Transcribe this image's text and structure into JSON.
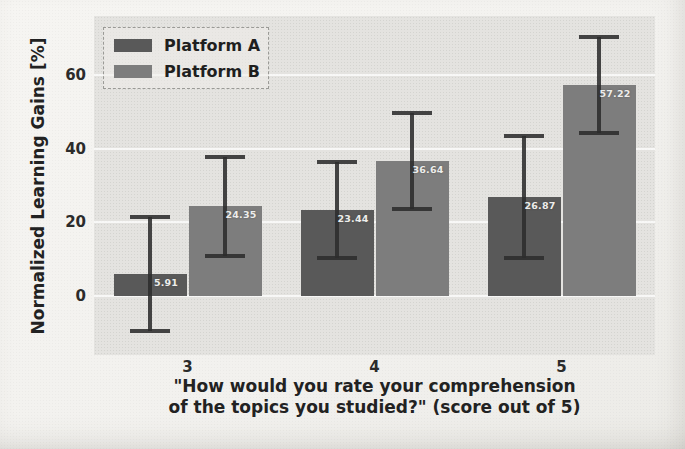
{
  "chart_data": {
    "type": "bar",
    "title": "",
    "ylabel": "Normalized Learning Gains [%]",
    "xlabel_line1": "\"How would you rate your comprehension",
    "xlabel_line2": "of the topics you studied?\" (score out of 5)",
    "categories": [
      "3",
      "4",
      "5"
    ],
    "series": [
      {
        "name": "Platform A",
        "color": "#595959",
        "values": [
          5.91,
          23.44,
          26.87
        ],
        "errors": [
          15.5,
          13.0,
          16.5
        ]
      },
      {
        "name": "Platform B",
        "color": "#7d7d7d",
        "values": [
          24.35,
          36.64,
          57.22
        ],
        "errors": [
          13.5,
          13.0,
          13.0
        ]
      }
    ],
    "bar_value_labels": [
      "5.91",
      "23.44",
      "26.87",
      "24.35",
      "36.64",
      "57.22"
    ],
    "yticks": [
      0,
      20,
      40,
      60
    ],
    "ylim": [
      -16,
      76
    ],
    "grid": "horizontal-white",
    "legend_position": "upper-left",
    "errorbar_color": "#2c2c2c",
    "plot_background": "#e4e3e0",
    "page_background": "#f2f1ee"
  }
}
